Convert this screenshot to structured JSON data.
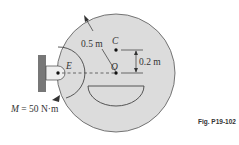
{
  "diagram": {
    "caption": "Fig. P19-102",
    "labels": {
      "radius": "0.5 m",
      "offset": "0.2 m",
      "point_c": "C",
      "point_o": "O",
      "point_e": "E",
      "moment_symbol": "M",
      "moment_value": " = 50 N·m"
    },
    "colors": {
      "disk_fill": "#dcdcdc",
      "wall_fill": "#777777",
      "line": "#333333",
      "cutout_fill": "#ffffff"
    }
  }
}
